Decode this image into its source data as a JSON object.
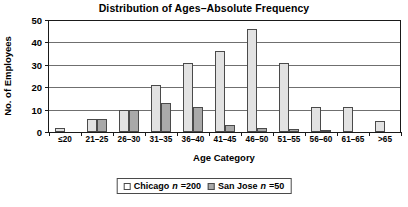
{
  "chart_data": {
    "type": "bar",
    "title": "Distribution of Ages–Absolute Frequency",
    "xlabel": "Age Category",
    "ylabel": "No. of Employees",
    "categories": [
      "≤20",
      "21–25",
      "26–30",
      "31–35",
      "36–40",
      "41–45",
      "46–50",
      "51–55",
      "56–60",
      "61–65",
      ">65"
    ],
    "series": [
      {
        "name": "Chicago",
        "n": 200,
        "color": "#e2e2e2",
        "values": [
          2,
          6,
          10,
          21,
          31,
          36,
          46,
          31,
          11,
          11,
          5
        ]
      },
      {
        "name": "San Jose",
        "n": 50,
        "color": "#a9a9a9",
        "values": [
          0,
          6,
          10,
          13,
          11,
          3,
          2,
          1.5,
          1,
          0,
          0
        ]
      }
    ],
    "ylim": [
      0,
      50
    ],
    "yticks": [
      0,
      10,
      20,
      30,
      40,
      50
    ],
    "ytick_labels": [
      "0",
      "10",
      "20",
      "30",
      "40",
      "50"
    ],
    "grid": true,
    "grid_axis": "y",
    "legend_position": "bottom-center"
  },
  "legend": {
    "entries": [
      {
        "label": "Chicago",
        "n_symbol": "n",
        "n_text": "=200"
      },
      {
        "label": "San Jose",
        "n_symbol": "n",
        "n_text": "=50"
      }
    ]
  }
}
